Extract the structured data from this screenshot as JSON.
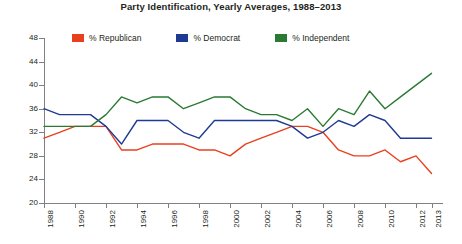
{
  "chart": {
    "title": "Party Identification, Yearly Averages, 1988–2013"
  },
  "legend": {
    "position": "top",
    "items": [
      {
        "label": "% Republican",
        "color": "#e8401f"
      },
      {
        "label": "% Democrat",
        "color": "#1f3a93"
      },
      {
        "label": "% Independent",
        "color": "#2a7a33"
      }
    ]
  },
  "axes": {
    "y_ticks": [
      "48",
      "44",
      "40",
      "36",
      "32",
      "28",
      "24",
      "20"
    ],
    "x_ticks": [
      "1988",
      "1990",
      "1992",
      "1994",
      "1996",
      "1998",
      "2000",
      "2002",
      "2004",
      "2006",
      "2008",
      "2010",
      "2012",
      "2013"
    ]
  },
  "chart_data": {
    "type": "line",
    "title": "Party Identification, Yearly Averages, 1988–2013",
    "xlabel": "",
    "ylabel": "",
    "ylim": [
      20,
      48
    ],
    "ytick_step": 4,
    "grid": false,
    "legend_position": "top",
    "x": [
      1988,
      1989,
      1990,
      1991,
      1992,
      1993,
      1994,
      1995,
      1996,
      1997,
      1998,
      1999,
      2000,
      2001,
      2002,
      2003,
      2004,
      2005,
      2006,
      2007,
      2008,
      2009,
      2010,
      2011,
      2012,
      2013
    ],
    "xtick_labels": [
      "1988",
      "1990",
      "1992",
      "1994",
      "1996",
      "1998",
      "2000",
      "2002",
      "2004",
      "2006",
      "2008",
      "2010",
      "2012",
      "2013"
    ],
    "series": [
      {
        "name": "% Republican",
        "color": "#e8401f",
        "values": [
          31,
          32,
          33,
          33,
          33,
          29,
          29,
          30,
          30,
          30,
          29,
          29,
          28,
          30,
          31,
          32,
          33,
          33,
          32,
          29,
          28,
          28,
          29,
          27,
          28,
          25
        ]
      },
      {
        "name": "% Democrat",
        "color": "#1f3a93",
        "values": [
          36,
          35,
          35,
          35,
          33,
          30,
          34,
          34,
          34,
          32,
          31,
          34,
          34,
          34,
          34,
          34,
          33,
          31,
          32,
          34,
          33,
          35,
          34,
          31,
          31,
          31
        ]
      },
      {
        "name": "% Independent",
        "color": "#2a7a33",
        "values": [
          33,
          33,
          33,
          33,
          35,
          38,
          37,
          38,
          38,
          36,
          37,
          38,
          38,
          36,
          35,
          35,
          34,
          36,
          33,
          36,
          35,
          39,
          36,
          38,
          40,
          42
        ]
      }
    ]
  }
}
